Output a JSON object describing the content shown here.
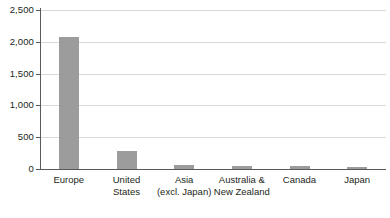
{
  "chart_data": {
    "type": "bar",
    "title": "",
    "subtitle": "",
    "xlabel": "",
    "ylabel": "",
    "categories": [
      "Europe",
      "United States",
      "Asia (excl. Japan)",
      "Australia & New Zealand",
      "Canada",
      "Japan"
    ],
    "category_lines": [
      [
        "Europe"
      ],
      [
        "United",
        "States"
      ],
      [
        "Asia",
        "(excl. Japan)"
      ],
      [
        "Australia &",
        "New Zealand"
      ],
      [
        "Canada"
      ],
      [
        "Japan"
      ]
    ],
    "values": [
      2075,
      285,
      65,
      45,
      40,
      35
    ],
    "ylim": [
      0,
      2500
    ],
    "ytick_values": [
      0,
      500,
      1000,
      1500,
      2000,
      2500
    ],
    "ytick_labels": [
      "0",
      "500",
      "1,000",
      "1,500",
      "2,000",
      "2,500"
    ],
    "grid": true,
    "grid_axis": "y",
    "legend": false,
    "legend_position": "none",
    "bar_color": "#9c9c9c",
    "axis_color": "#58595b",
    "grid_color": "#d9d9d9",
    "background_color": "#ffffff"
  }
}
